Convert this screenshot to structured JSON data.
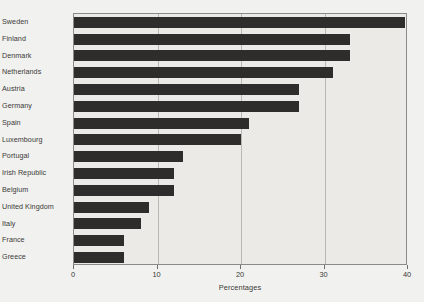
{
  "chart_data": {
    "type": "bar",
    "orientation": "horizontal",
    "title": "",
    "xlabel": "Percentages",
    "ylabel": "",
    "xlim": [
      0,
      40
    ],
    "xticks": [
      0,
      10,
      20,
      30,
      40
    ],
    "xtick_labels": [
      "0",
      "10",
      "20",
      "30",
      "40"
    ],
    "grid": "vertical",
    "legend": "none",
    "categories": [
      "Sweden",
      "Finland",
      "Denmark",
      "Netherlands",
      "Austria",
      "Germany",
      "Spain",
      "Luxembourg",
      "Portugal",
      "Irish Republic",
      "Belgium",
      "United Kingdom",
      "Italy",
      "France",
      "Greece"
    ],
    "values": [
      39.7,
      33,
      33,
      31,
      27,
      27,
      21,
      20,
      13,
      12,
      12,
      9,
      8,
      6,
      6
    ],
    "series": [
      {
        "name": "Percentages",
        "values": [
          39.7,
          33,
          33,
          31,
          27,
          27,
          21,
          20,
          13,
          12,
          12,
          9,
          8,
          6,
          6
        ]
      }
    ],
    "colors": {
      "bar": "#2e2d2c",
      "plot_background": "#eceae6",
      "figure_background": "#f1f1ef",
      "gridline": "#b9b8b4",
      "axis_frame": "#8a8a88",
      "text": "#3a3a38"
    }
  }
}
